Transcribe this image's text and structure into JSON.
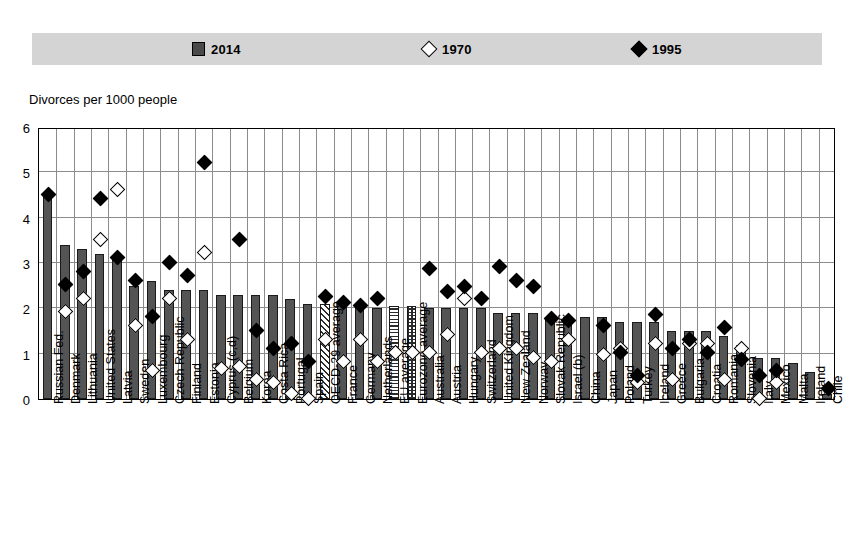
{
  "legend": {
    "items": [
      {
        "label": "2014",
        "marker": "filled-square",
        "color": "#4a4a4a"
      },
      {
        "label": "1970",
        "marker": "open-diamond",
        "color": "#ffffff"
      },
      {
        "label": "1995",
        "marker": "filled-diamond",
        "color": "#000000"
      }
    ],
    "background_color": "#d4d4d4"
  },
  "axis_title": "Divorces per 1000 people",
  "chart_data": {
    "type": "bar",
    "title": "Divorces per 1000 people",
    "xlabel": "",
    "ylabel": "Divorces per 1000 people",
    "ylim": [
      0,
      6
    ],
    "yticks": [
      0,
      1,
      2,
      3,
      4,
      5,
      6
    ],
    "grid": true,
    "legend_position": "top",
    "categories": [
      "Russian Fed.",
      "Denmark",
      "Lithuania",
      "United States",
      "Latvia",
      "Sweden",
      "Luxembourg",
      "Czech Republic",
      "Finland",
      "Estonia",
      "Cyprus (c,d)",
      "Belgium",
      "Korea",
      "Costa Rica",
      "Portugal",
      "Spain",
      "OECD-29 average",
      "France",
      "Germany",
      "Netherlands",
      "EU average",
      "Eurozone average",
      "Australia",
      "Austria",
      "Hungary",
      "Switzerland",
      "United Kingdom",
      "New Zealand",
      "Norway",
      "Slovak Republic",
      "Israel (b)",
      "China",
      "Japan",
      "Poland",
      "Turkey",
      "Iceland",
      "Greece",
      "Bulgaria",
      "Croatia",
      "Romania",
      "Slovenia",
      "Italy",
      "Mexico",
      "Malta",
      "Ireland",
      "Chile"
    ],
    "series": [
      {
        "name": "2014",
        "type": "bar",
        "values": [
          4.5,
          3.4,
          3.3,
          3.2,
          3.1,
          2.5,
          2.6,
          2.4,
          2.4,
          2.4,
          2.3,
          2.3,
          2.3,
          2.3,
          2.2,
          2.1,
          2.1,
          2.1,
          2.0,
          2.0,
          2.05,
          2.05,
          2.0,
          2.0,
          2.0,
          2.0,
          1.9,
          1.9,
          1.9,
          1.8,
          1.8,
          1.8,
          1.8,
          1.7,
          1.7,
          1.7,
          1.5,
          1.5,
          1.5,
          1.4,
          1.2,
          0.9,
          0.9,
          0.8,
          0.6,
          0.1
        ]
      },
      {
        "name": "1970",
        "type": "scatter",
        "values": [
          null,
          1.9,
          2.2,
          3.5,
          4.6,
          1.6,
          0.6,
          2.2,
          1.3,
          3.2,
          0.65,
          0.7,
          0.4,
          0.35,
          0.1,
          0.0,
          1.3,
          0.8,
          1.3,
          0.8,
          1.0,
          1.0,
          1.0,
          1.4,
          2.2,
          1.0,
          1.1,
          1.1,
          0.9,
          0.8,
          1.3,
          null,
          0.95,
          1.1,
          0.35,
          1.2,
          0.4,
          1.2,
          1.2,
          0.4,
          1.1,
          0.0,
          0.35,
          null,
          null,
          null
        ]
      },
      {
        "name": "1995",
        "type": "scatter",
        "values": [
          4.5,
          2.5,
          2.8,
          4.4,
          3.1,
          2.6,
          1.8,
          3.0,
          2.7,
          5.2,
          null,
          3.5,
          1.5,
          1.1,
          1.2,
          0.8,
          2.25,
          2.1,
          2.05,
          2.2,
          null,
          null,
          2.85,
          2.35,
          2.45,
          2.2,
          2.9,
          2.6,
          2.45,
          1.75,
          1.7,
          null,
          1.6,
          1.0,
          0.5,
          1.85,
          1.1,
          1.3,
          1.0,
          1.55,
          0.85,
          0.5,
          0.6,
          null,
          null,
          0.2
        ]
      }
    ]
  }
}
